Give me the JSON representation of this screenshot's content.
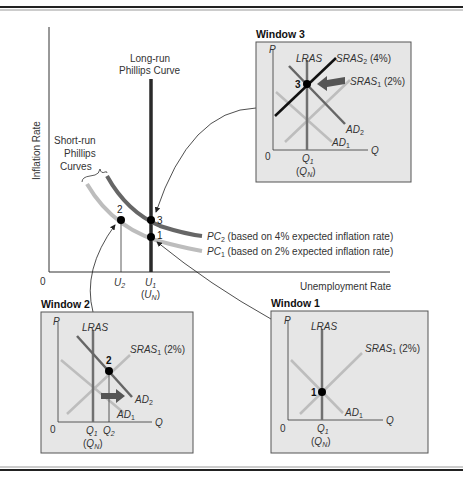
{
  "main_chart": {
    "y_axis_label": "Inflation Rate",
    "x_axis_label": "Unemployment Rate",
    "origin_label": "0",
    "lrpc_label_line1": "Long-run",
    "lrpc_label_line2": "Phillips Curve",
    "srpc_label_line1": "Short-run",
    "srpc_label_line2": "Phillips",
    "srpc_label_line3": "Curves",
    "pc2": {
      "name": "PC",
      "sub": "2",
      "desc": " (based on 4% expected inflation rate)"
    },
    "pc1": {
      "name": "PC",
      "sub": "1",
      "desc": " (based on 2% expected inflation rate)"
    },
    "x_ticks": {
      "u2": {
        "name": "U",
        "sub": "2"
      },
      "u1": {
        "name": "U",
        "sub": "1"
      },
      "un": {
        "open": "(",
        "name": "U",
        "sub": "N",
        "close": ")"
      }
    },
    "points": [
      "1",
      "2",
      "3"
    ]
  },
  "windows": {
    "w3": {
      "title": "Window 3",
      "p": "P",
      "q": "Q",
      "zero": "0",
      "lras": "LRAS",
      "sras2": {
        "name": "SRAS",
        "sub": "2",
        "pct": " (4%)"
      },
      "sras1": {
        "name": "SRAS",
        "sub": "1",
        "pct": " (2%)"
      },
      "ad2": {
        "name": "AD",
        "sub": "2"
      },
      "ad1": {
        "name": "AD",
        "sub": "1"
      },
      "q1": {
        "name": "Q",
        "sub": "1"
      },
      "qn": {
        "open": "(",
        "name": "Q",
        "sub": "N",
        "close": ")"
      },
      "point": "3"
    },
    "w2": {
      "title": "Window 2",
      "p": "P",
      "q": "Q",
      "zero": "0",
      "lras": "LRAS",
      "sras1": {
        "name": "SRAS",
        "sub": "1",
        "pct": " (2%)"
      },
      "ad2": {
        "name": "AD",
        "sub": "2"
      },
      "ad1": {
        "name": "AD",
        "sub": "1"
      },
      "q1": {
        "name": "Q",
        "sub": "1"
      },
      "q2": {
        "name": "Q",
        "sub": "2"
      },
      "qn": {
        "open": "(",
        "name": "Q",
        "sub": "N",
        "close": ")"
      },
      "point": "2"
    },
    "w1": {
      "title": "Window 1",
      "p": "P",
      "q": "Q",
      "zero": "0",
      "lras": "LRAS",
      "sras1": {
        "name": "SRAS",
        "sub": "1",
        "pct": " (2%)"
      },
      "ad1": {
        "name": "AD",
        "sub": "1"
      },
      "q1": {
        "name": "Q",
        "sub": "1"
      },
      "qn": {
        "open": "(",
        "name": "Q",
        "sub": "N",
        "close": ")"
      },
      "point": "1"
    }
  },
  "colors": {
    "window_bg": "#e6e6e6",
    "window_border": "#555555",
    "lras": "#707070",
    "light_curve": "#bdbdbd",
    "dark_curve": "#666666",
    "sras2": "#111111",
    "lrpc": "#2a2a2a"
  }
}
